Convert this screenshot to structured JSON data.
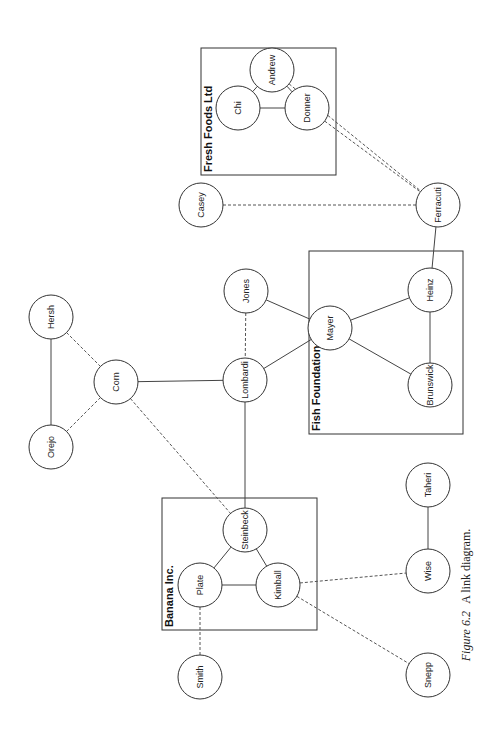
{
  "caption": {
    "figure_label": "Figure 6.2",
    "text": "A link diagram."
  },
  "groups": [
    {
      "id": "fresh-foods",
      "label": "Fresh Foods Ltd",
      "x": 201,
      "y": 48,
      "w": 135,
      "h": 127
    },
    {
      "id": "fish-foundation",
      "label": "Fish Foundation",
      "x": 309,
      "y": 251,
      "w": 154,
      "h": 183
    },
    {
      "id": "banana-inc",
      "label": "Banana Inc.",
      "x": 162,
      "y": 498,
      "w": 155,
      "h": 132
    }
  ],
  "nodes": [
    {
      "id": "andrew",
      "label": "Andrew",
      "x": 272,
      "y": 70
    },
    {
      "id": "chi",
      "label": "Chi",
      "x": 238,
      "y": 108
    },
    {
      "id": "donner",
      "label": "Donner",
      "x": 307,
      "y": 108
    },
    {
      "id": "casey",
      "label": "Casey",
      "x": 201,
      "y": 205
    },
    {
      "id": "ferracuti",
      "label": "Ferracuti",
      "x": 438,
      "y": 205
    },
    {
      "id": "jones",
      "label": "Jones",
      "x": 246,
      "y": 291
    },
    {
      "id": "mayer",
      "label": "Mayer",
      "x": 330,
      "y": 328
    },
    {
      "id": "heinz",
      "label": "Heinz",
      "x": 430,
      "y": 290
    },
    {
      "id": "brunswick",
      "label": "Brunswick",
      "x": 430,
      "y": 385
    },
    {
      "id": "lombardi",
      "label": "Lombardi",
      "x": 245,
      "y": 380
    },
    {
      "id": "corn",
      "label": "Corn",
      "x": 116,
      "y": 382
    },
    {
      "id": "hersh",
      "label": "Hersh",
      "x": 51,
      "y": 317
    },
    {
      "id": "orejo",
      "label": "Orejo",
      "x": 51,
      "y": 447
    },
    {
      "id": "steinbeck",
      "label": "Steinbeck",
      "x": 245,
      "y": 530
    },
    {
      "id": "plate",
      "label": "Plate",
      "x": 200,
      "y": 585
    },
    {
      "id": "kimball",
      "label": "Kimball",
      "x": 278,
      "y": 585
    },
    {
      "id": "smith",
      "label": "Smith",
      "x": 200,
      "y": 677
    },
    {
      "id": "snepp",
      "label": "Snepp",
      "x": 428,
      "y": 675
    },
    {
      "id": "wise",
      "label": "Wise",
      "x": 428,
      "y": 571
    },
    {
      "id": "taheri",
      "label": "Taheri",
      "x": 428,
      "y": 485
    }
  ],
  "edges": [
    {
      "from": "andrew",
      "to": "chi",
      "style": "solid"
    },
    {
      "from": "andrew",
      "to": "donner",
      "style": "solid"
    },
    {
      "from": "chi",
      "to": "donner",
      "style": "solid"
    },
    {
      "from": "andrew",
      "to": "ferracuti",
      "style": "dashed"
    },
    {
      "from": "donner",
      "to": "ferracuti",
      "style": "dashed"
    },
    {
      "from": "casey",
      "to": "ferracuti",
      "style": "dashed"
    },
    {
      "from": "ferracuti",
      "to": "heinz",
      "style": "solid"
    },
    {
      "from": "mayer",
      "to": "heinz",
      "style": "solid"
    },
    {
      "from": "mayer",
      "to": "brunswick",
      "style": "solid"
    },
    {
      "from": "heinz",
      "to": "brunswick",
      "style": "solid"
    },
    {
      "from": "jones",
      "to": "mayer",
      "style": "solid"
    },
    {
      "from": "lombardi",
      "to": "mayer",
      "style": "solid"
    },
    {
      "from": "jones",
      "to": "lombardi",
      "style": "dashed"
    },
    {
      "from": "corn",
      "to": "lombardi",
      "style": "solid"
    },
    {
      "from": "hersh",
      "to": "corn",
      "style": "dashed"
    },
    {
      "from": "orejo",
      "to": "corn",
      "style": "dashed"
    },
    {
      "from": "hersh",
      "to": "orejo",
      "style": "solid"
    },
    {
      "from": "corn",
      "to": "steinbeck",
      "style": "dashed"
    },
    {
      "from": "lombardi",
      "to": "steinbeck",
      "style": "solid"
    },
    {
      "from": "steinbeck",
      "to": "plate",
      "style": "solid"
    },
    {
      "from": "steinbeck",
      "to": "kimball",
      "style": "solid"
    },
    {
      "from": "plate",
      "to": "kimball",
      "style": "solid"
    },
    {
      "from": "plate",
      "to": "smith",
      "style": "dashed"
    },
    {
      "from": "kimball",
      "to": "wise",
      "style": "dashed"
    },
    {
      "from": "kimball",
      "to": "snepp",
      "style": "dashed"
    },
    {
      "from": "wise",
      "to": "taheri",
      "style": "solid"
    }
  ],
  "style": {
    "node_radius": 22,
    "line_color": "#444444",
    "background": "#ffffff"
  }
}
